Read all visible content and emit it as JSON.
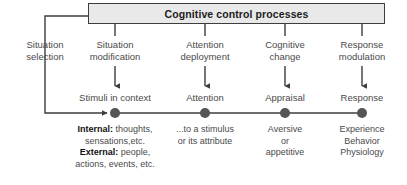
{
  "figure": {
    "title": "Cognitive control processes",
    "type": "process-model-flow-diagram"
  },
  "header_box": {
    "label": "Cognitive control processes",
    "fill_color": "#e9e9e9",
    "border_color": "#3d3d3d"
  },
  "strategies": [
    {
      "id": "situation-selection",
      "line1": "Situation",
      "line2": "selection",
      "center_x": 45
    },
    {
      "id": "situation-modification",
      "line1": "Situation",
      "line2": "modification",
      "center_x": 115
    },
    {
      "id": "attention-deployment",
      "line1": "Attention",
      "line2": "deployment",
      "center_x": 205
    },
    {
      "id": "cognitive-change",
      "line1": "Cognitive",
      "line2": "change",
      "center_x": 285
    },
    {
      "id": "response-modulation",
      "line1": "Response",
      "line2": "modulation",
      "center_x": 362
    }
  ],
  "stages": [
    {
      "id": "stimuli-in-context",
      "label": "Stimuli in context",
      "center_x": 115
    },
    {
      "id": "attention",
      "label": "Attention",
      "center_x": 205
    },
    {
      "id": "appraisal",
      "label": "Appraisal",
      "center_x": 285
    },
    {
      "id": "response",
      "label": "Response",
      "center_x": 362
    }
  ],
  "details": [
    {
      "id": "stimuli-detail",
      "center_x": 115,
      "lines": [
        {
          "bold": "Internal:",
          "rest": " thoughts,"
        },
        {
          "bold": "",
          "rest": "sensations,etc."
        },
        {
          "bold": "External:",
          "rest": " people,"
        },
        {
          "bold": "",
          "rest": "actions, events, etc."
        }
      ]
    },
    {
      "id": "attention-detail",
      "center_x": 205,
      "lines": [
        {
          "bold": "",
          "rest": "...to a stimulus"
        },
        {
          "bold": "",
          "rest": "or its attribute"
        }
      ]
    },
    {
      "id": "appraisal-detail",
      "center_x": 285,
      "lines": [
        {
          "bold": "",
          "rest": "Aversive"
        },
        {
          "bold": "",
          "rest": "or"
        },
        {
          "bold": "",
          "rest": "appetitive"
        }
      ]
    },
    {
      "id": "response-detail",
      "center_x": 362,
      "lines": [
        {
          "bold": "",
          "rest": "Experience"
        },
        {
          "bold": "",
          "rest": "Behavior"
        },
        {
          "bold": "",
          "rest": "Physiology"
        }
      ]
    }
  ],
  "timeline": {
    "node_color": "#555555",
    "line_color": "#3d3d3d",
    "y": 113,
    "nodes_x": [
      115,
      205,
      285,
      362
    ],
    "start_x": 115,
    "end_x": 362
  },
  "feedback_path": {
    "description": "Situation selection branch: left from box, down, right into first node",
    "corner_x": 45,
    "top_y": 16,
    "bottom_y": 113
  },
  "colors": {
    "ink": "#3d3d3d",
    "text": "#4a4a4a",
    "bold_text": "#111111",
    "box_fill": "#e9e9e9",
    "node": "#555555",
    "background": "#ffffff"
  }
}
